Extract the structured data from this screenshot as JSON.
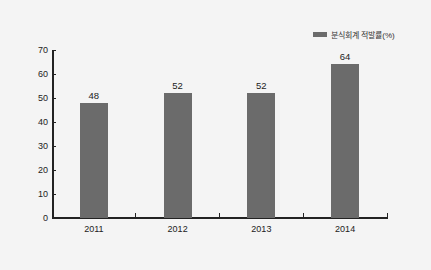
{
  "chart_data": {
    "type": "bar",
    "title": "",
    "categories": [
      "2011",
      "2012",
      "2013",
      "2014"
    ],
    "series": [
      {
        "name": "분식회계 적발률(%)",
        "values": [
          48,
          52,
          52,
          64
        ]
      }
    ],
    "xlabel": "",
    "ylabel": "",
    "ylim": [
      0,
      70
    ],
    "yticks": [
      "0",
      "10",
      "20",
      "30",
      "40",
      "50",
      "60",
      "70"
    ],
    "data_labels": [
      "48",
      "52",
      "52",
      "64"
    ],
    "grid": false,
    "legend_position": "top-right",
    "bar_color": "#6b6b6b"
  },
  "legend": {
    "label": "분식회계 적발률(%)"
  }
}
